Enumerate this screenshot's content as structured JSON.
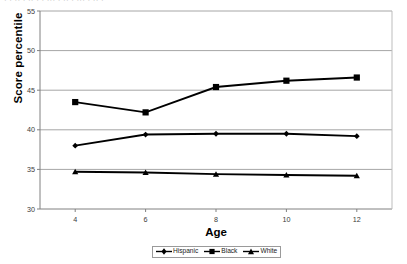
{
  "chart_data": {
    "type": "line",
    "title": "",
    "xlabel": "Age",
    "ylabel": "Score percentile",
    "x": [
      4,
      6,
      8,
      10,
      12
    ],
    "xtick_labels": [
      "4",
      "6",
      "8",
      "10",
      "12"
    ],
    "ytick_labels": [
      "30",
      "35",
      "40",
      "45",
      "50",
      "55"
    ],
    "yticks": [
      30,
      35,
      40,
      45,
      50,
      55
    ],
    "xlim": [
      3,
      13
    ],
    "ylim": [
      30,
      55
    ],
    "grid": "horizontal",
    "legend_position": "bottom",
    "series": [
      {
        "name": "Hispanic",
        "marker": "diamond",
        "color": "#000000",
        "values": [
          38.0,
          39.4,
          39.5,
          39.5,
          39.2
        ]
      },
      {
        "name": "Black",
        "marker": "square",
        "color": "#000000",
        "values": [
          43.5,
          42.2,
          45.4,
          46.2,
          46.6
        ]
      },
      {
        "name": "White",
        "marker": "triangle",
        "color": "#000000",
        "values": [
          34.7,
          34.6,
          34.4,
          34.3,
          34.2
        ]
      }
    ]
  },
  "axes": {
    "y_title": "Score percentile",
    "x_title": "Age"
  },
  "legend": {
    "items": [
      {
        "label": "Hispanic",
        "marker": "diamond"
      },
      {
        "label": "Black",
        "marker": "square"
      },
      {
        "label": "White",
        "marker": "triangle"
      }
    ]
  },
  "artifacts": {
    "top_clipped_text": "· ·  ··   · ·· ·  · ···   · ··  · ···  ·  ·· ·"
  }
}
